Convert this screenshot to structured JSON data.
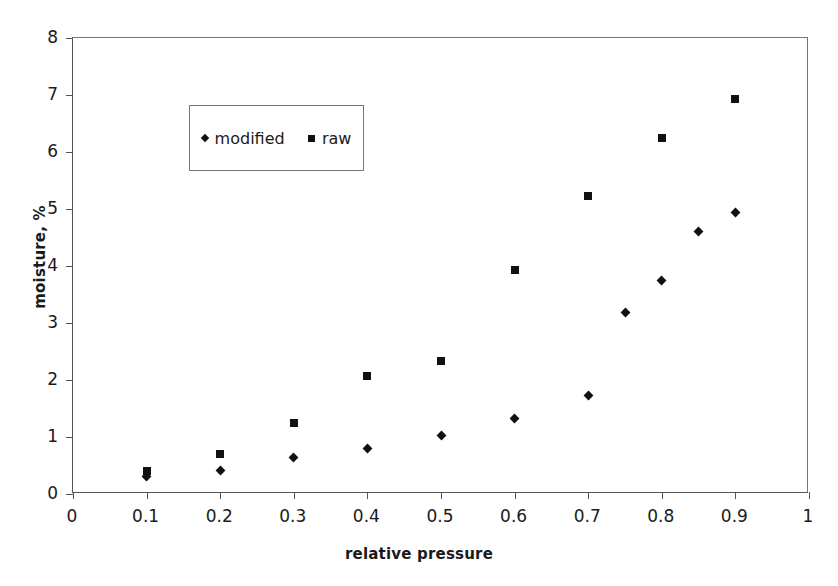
{
  "chart_data": {
    "type": "scatter",
    "title": "",
    "xlabel": "relative pressure",
    "ylabel": "moisture, %",
    "xlim": [
      0,
      1
    ],
    "ylim": [
      0,
      8
    ],
    "xticks": [
      "0",
      "0.1",
      "0.2",
      "0.3",
      "0.4",
      "0.5",
      "0.6",
      "0.7",
      "0.8",
      "0.9",
      "1"
    ],
    "xtick_values": [
      0,
      0.1,
      0.2,
      0.3,
      0.4,
      0.5,
      0.6,
      0.7,
      0.8,
      0.9,
      1
    ],
    "yticks": [
      "0",
      "1",
      "2",
      "3",
      "4",
      "5",
      "6",
      "7",
      "8"
    ],
    "ytick_values": [
      0,
      1,
      2,
      3,
      4,
      5,
      6,
      7,
      8
    ],
    "grid": false,
    "legend_position": "upper-left-inside",
    "series": [
      {
        "name": "modified",
        "marker": "diamond",
        "color": "#111111",
        "x": [
          0.1,
          0.2,
          0.3,
          0.4,
          0.5,
          0.6,
          0.7,
          0.75,
          0.8,
          0.85,
          0.9
        ],
        "y": [
          0.3,
          0.42,
          0.64,
          0.8,
          1.03,
          1.32,
          1.73,
          3.19,
          3.75,
          4.61,
          4.94
        ]
      },
      {
        "name": "raw",
        "marker": "square",
        "color": "#111111",
        "x": [
          0.1,
          0.2,
          0.3,
          0.4,
          0.5,
          0.6,
          0.7,
          0.8,
          0.9
        ],
        "y": [
          0.4,
          0.71,
          1.24,
          2.07,
          2.34,
          3.93,
          5.22,
          6.24,
          6.93
        ]
      }
    ]
  },
  "legend": {
    "entries": [
      {
        "label": "modified",
        "marker": "diamond"
      },
      {
        "label": "raw",
        "marker": "square"
      }
    ]
  }
}
